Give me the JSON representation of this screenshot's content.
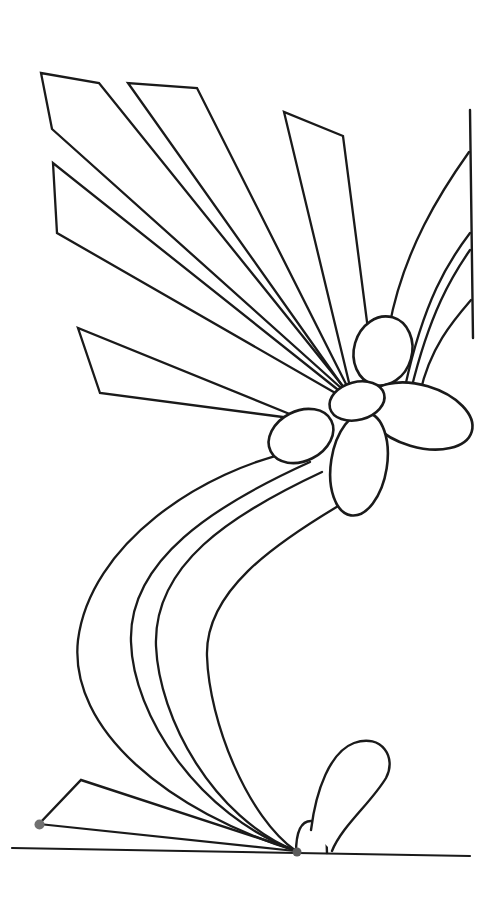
{
  "canvas": {
    "width": 490,
    "height": 902,
    "background": "#ffffff",
    "stroke_color": "#1a1a1a",
    "default_stroke_width": 2.3,
    "dot_color_left": "#707070",
    "dot_color_center": "#5a5a5a"
  },
  "shapes": [
    {
      "name": "ray-kite-upper-left",
      "type": "path",
      "d": "M 350,396 L 52,129 L 41,73 L 99,83 L 346,390",
      "fill": "none",
      "stroke_width": 2.3
    },
    {
      "name": "ray-thin-left",
      "type": "path",
      "d": "M 342,393 L 53,163 L 57,233 L 344,398",
      "fill": "none",
      "stroke_width": 2.3
    },
    {
      "name": "ray-middle",
      "type": "path",
      "d": "M 346,391 L 128,83 L 197,88 L 350,392",
      "fill": "none",
      "stroke_width": 2.3
    },
    {
      "name": "ray-upper-right",
      "type": "path",
      "d": "M 352,395 L 284,112 L 343,136 L 370,345",
      "fill": "none",
      "stroke_width": 2.3
    },
    {
      "name": "ray-horizontal-left",
      "type": "path",
      "d": "M 298,419 L 100,393 L 78,328 L 297,417",
      "fill": "none",
      "stroke_width": 2.3
    },
    {
      "name": "border-line-right",
      "type": "line",
      "x1": 470,
      "y1": 110,
      "x2": 473,
      "y2": 338,
      "stroke_width": 2.4
    },
    {
      "name": "branch-curve-1",
      "type": "path",
      "d": "M 469,152 C 442,190 403,250 389,328",
      "fill": "none",
      "stroke_width": 2.3
    },
    {
      "name": "branch-curve-2",
      "type": "path",
      "d": "M 470,233 C 448,262 424,300 405,387",
      "fill": "none",
      "stroke_width": 2.3
    },
    {
      "name": "branch-curve-3",
      "type": "path",
      "d": "M 470,250 C 452,276 430,312 411,390",
      "fill": "none",
      "stroke_width": 2.3
    },
    {
      "name": "branch-curve-4",
      "type": "path",
      "d": "M 471,300 C 452,322 430,348 420,393",
      "fill": "none",
      "stroke_width": 2.3
    },
    {
      "name": "stem-curve-1",
      "type": "path",
      "d": "M 300,450 C 200,470 90,545 78,640 C 68,730 170,812 296,851",
      "fill": "none",
      "stroke_width": 2.3
    },
    {
      "name": "stem-curve-2",
      "type": "path",
      "d": "M 310,462 C 215,505 128,560 131,642 C 133,715 198,815 296,851",
      "fill": "none",
      "stroke_width": 2.3
    },
    {
      "name": "stem-curve-3",
      "type": "path",
      "d": "M 322,472 C 230,515 153,565 156,646 C 159,718 213,818 296,851",
      "fill": "none",
      "stroke_width": 2.3
    },
    {
      "name": "stem-curve-4",
      "type": "path",
      "d": "M 345,502 C 272,545 205,592 207,656 C 209,722 248,818 296,851",
      "fill": "none",
      "stroke_width": 2.3
    },
    {
      "name": "ground-fan-upper-edge",
      "type": "path",
      "d": "M 39,824 L 81,780 L 295,850",
      "fill": "none",
      "stroke_width": 2.4
    },
    {
      "name": "ground-fan-lower-edge",
      "type": "line",
      "x1": 39,
      "y1": 824,
      "x2": 295,
      "y2": 851,
      "stroke_width": 2.2
    },
    {
      "name": "bud-dome",
      "type": "path",
      "d": "M 296,853 C 296,832 301,821 311,821 C 321,821 327,832 327,853",
      "fill": "#ffffff",
      "stroke_width": 2.4
    },
    {
      "name": "bud-teardrop-petal",
      "type": "path",
      "d": "M 311,830 C 316,790 330,752 354,743 C 382,733 397,758 386,778 C 371,803 342,826 332,851",
      "fill": "#ffffff",
      "stroke_width": 2.4
    },
    {
      "name": "ground-line",
      "type": "line",
      "x1": 12,
      "y1": 848,
      "x2": 470,
      "y2": 856,
      "stroke_width": 2.2
    },
    {
      "name": "flower-petal-top",
      "type": "ellipse",
      "cx": 383,
      "cy": 351,
      "rx": 29,
      "ry": 35,
      "rotate": 16,
      "fill": "#ffffff",
      "stroke_width": 2.6
    },
    {
      "name": "flower-petal-right",
      "type": "ellipse",
      "cx": 419,
      "cy": 416,
      "rx": 55,
      "ry": 31,
      "rotate": 16.5,
      "fill": "#ffffff",
      "stroke_width": 2.6
    },
    {
      "name": "flower-petal-bottom",
      "type": "ellipse",
      "cx": 359,
      "cy": 464,
      "rx": 28,
      "ry": 52,
      "rotate": 9,
      "fill": "#ffffff",
      "stroke_width": 2.6
    },
    {
      "name": "flower-petal-left",
      "type": "ellipse",
      "cx": 301,
      "cy": 436,
      "rx": 34,
      "ry": 25,
      "rotate": -27,
      "fill": "#ffffff",
      "stroke_width": 2.6
    },
    {
      "name": "flower-center-disk",
      "type": "ellipse",
      "cx": 357,
      "cy": 401,
      "rx": 28,
      "ry": 19,
      "rotate": -15,
      "fill": "#ffffff",
      "stroke_width": 2.6
    },
    {
      "name": "anchor-dot-left",
      "type": "circle",
      "cx": 39.5,
      "cy": 824.5,
      "r": 5,
      "fill": "#707070",
      "stroke": "none",
      "stroke_width": 0
    },
    {
      "name": "anchor-dot-center",
      "type": "circle",
      "cx": 297,
      "cy": 852,
      "r": 4.5,
      "fill": "#5a5a5a",
      "stroke": "none",
      "stroke_width": 0
    }
  ]
}
